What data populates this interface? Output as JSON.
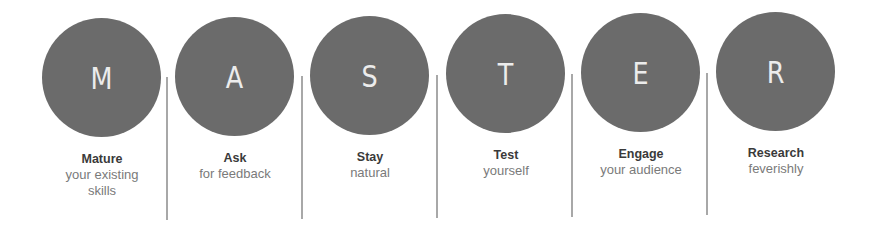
{
  "diagram": {
    "acronym": "MASTER",
    "colors": {
      "circle": "#6b6b6b",
      "letter": "#ececec",
      "title": "#3a3a3a",
      "subtitle": "#7a7a7a",
      "divider": "#a8a8a8"
    },
    "steps": [
      {
        "letter": "M",
        "title": "Mature",
        "subtitle": "your existing skills"
      },
      {
        "letter": "A",
        "title": "Ask",
        "subtitle": "for feedback"
      },
      {
        "letter": "S",
        "title": "Stay",
        "subtitle": "natural"
      },
      {
        "letter": "T",
        "title": "Test",
        "subtitle": "yourself"
      },
      {
        "letter": "E",
        "title": "Engage",
        "subtitle": "your audience"
      },
      {
        "letter": "R",
        "title": "Research",
        "subtitle": "feverishly"
      }
    ]
  }
}
